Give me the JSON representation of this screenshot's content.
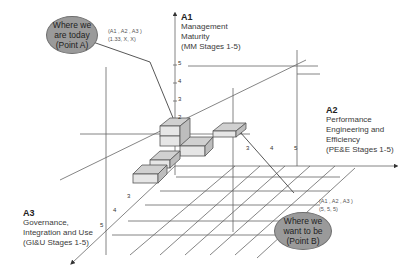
{
  "axes": {
    "a1": {
      "name": "A1",
      "lines": [
        "Management",
        "Maturity",
        "(MM Stages 1-5)"
      ],
      "ticks": [
        "2",
        "3",
        "4",
        "5"
      ]
    },
    "a2": {
      "name": "A2",
      "lines": [
        "Performance",
        "Engineering and",
        "Efficiency",
        "(PE&E Stages 1-5)"
      ],
      "ticks": [
        "3",
        "4",
        "5"
      ]
    },
    "a3": {
      "name": "A3",
      "lines": [
        "Governance,",
        "Integration and Use",
        "(GI&U Stages 1-5)"
      ],
      "ticks": [
        "3",
        "4",
        "5"
      ]
    }
  },
  "point_a": {
    "bubble": [
      "Where we",
      "are today",
      "(Point A)"
    ],
    "coord_label": "(A1 , A2 , A3 )",
    "coord_value": "(1.33, X, X)"
  },
  "point_b": {
    "bubble": [
      "Where we",
      "want to be",
      "(Point B)"
    ],
    "coord_label": "(A1 , A2 , A3 )",
    "coord_value": "(5, 5, 5)"
  },
  "colors": {
    "block_fill": "#e4e4e4",
    "bubble_fill": "#9a9a9a",
    "line": "#555555"
  }
}
